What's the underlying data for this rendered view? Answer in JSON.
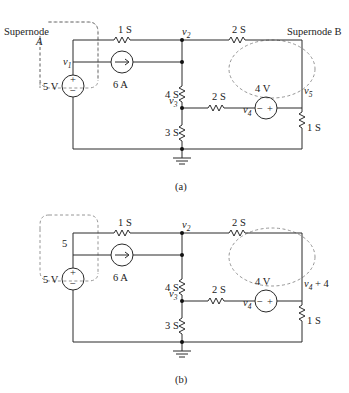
{
  "circuit_a": {
    "caption": "(a)",
    "supernode_a_label_1": "Supernode",
    "supernode_a_label_2": "A",
    "supernode_b_label": "Supernode B",
    "node_v1": "v",
    "node_v1_sub": "1",
    "node_v2": "v",
    "node_v2_sub": "2",
    "node_v3": "v",
    "node_v3_sub": "3",
    "node_v4": "v",
    "node_v4_sub": "4",
    "node_v5": "v",
    "node_v5_sub": "5",
    "r_top_left": "1 S",
    "r_top_right": "2 S",
    "r_mid_vertical": "4 S",
    "r_mid_horizontal": "2 S",
    "r_bottom_vertical": "3 S",
    "r_right_vertical": "1 S",
    "source_voltage_left": "5 V",
    "source_current": "6 A",
    "source_voltage_mid": "4 V"
  },
  "circuit_b": {
    "caption": "(b)",
    "node_left": "5",
    "node_v2": "v",
    "node_v2_sub": "2",
    "node_v3": "v",
    "node_v3_sub": "3",
    "node_v4": "v",
    "node_v4_sub": "4",
    "node_right": "v",
    "node_right_sub": "4",
    "node_right_suffix": " + 4",
    "r_top_left": "1 S",
    "r_top_right": "2 S",
    "r_mid_vertical": "4 S",
    "r_mid_horizontal": "2 S",
    "r_bottom_vertical": "3 S",
    "r_right_vertical": "1 S",
    "source_voltage_left": "5 V",
    "source_current": "6 A",
    "source_voltage_mid": "4 V"
  },
  "symbols": {
    "plus": "+",
    "minus": "−"
  }
}
